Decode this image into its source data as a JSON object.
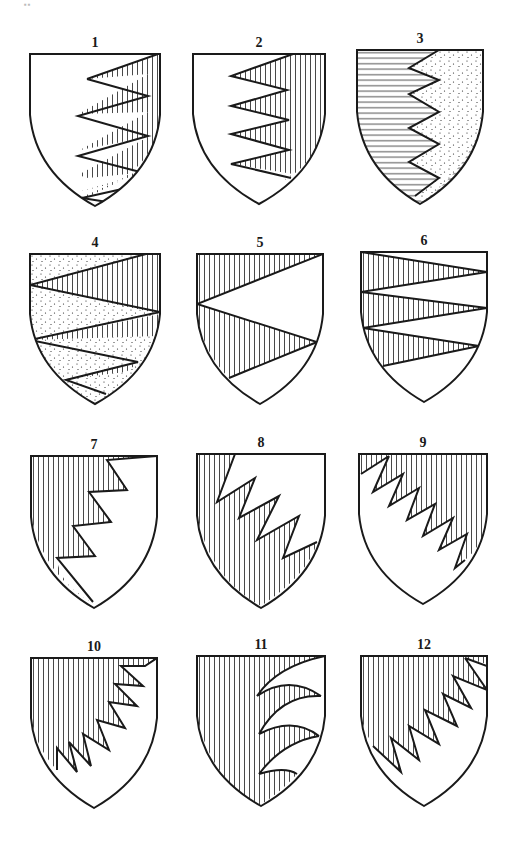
{
  "figure": {
    "corner_mark": "▪▪",
    "colors": {
      "ink": "#1a1a1a",
      "paper": "#ffffff"
    },
    "tinctures": {
      "vhatch": "vertical hatching",
      "hhatch": "horizontal hatching",
      "dots": "stippling",
      "plain": "plain"
    },
    "shields": [
      {
        "label": "1",
        "x": 30,
        "y": 54,
        "w": 130,
        "h": 152,
        "parts": [
          {
            "fill": "plain",
            "d": "SHIELD"
          },
          {
            "fill": "vhatch",
            "d": "M130 0 L130 0 L130 60 Q126 108 86 128 L36 150 L44 150 L52 146 L88 128 L48 138 L118 118 L58 124 L48 121 L118 83 L50 96 L118 58 L50 60 L52 58 L118 20 L57 25 L130 0 Z"
          }
        ],
        "lines": "M57 25 L128 0 M57 25 L118 42 L48 62 L118 82 L48 102 L118 120 M90 150 L52 144 L110 131"
      },
      {
        "label": "2",
        "x": 193,
        "y": 54,
        "w": 132,
        "h": 150,
        "parts": [
          {
            "fill": "plain",
            "d": "SHIELD"
          },
          {
            "fill": "vhatch",
            "d": "M100 0 L132 0 L132 60 Q128 108 88 128 L100 120 L38 110 L96 96 L38 80 L96 66 L38 52 L96 36 L38 22 Z"
          }
        ],
        "lines": "M100 0 L38 22 L94 36 L38 52 L96 66 L38 80 L96 96 L38 110 L98 124"
      },
      {
        "label": "3",
        "x": 357,
        "y": 50,
        "w": 126,
        "h": 154,
        "parts": [
          {
            "fill": "hhatch",
            "d": "SHIELD"
          },
          {
            "fill": "dots",
            "d": "M82 0 L126 0 L126 60 Q122 108 66 152 L58 146 L82 128 L52 112 L82 94 L52 78 L82 62 L52 44 L82 30 L52 18 Z"
          }
        ],
        "lines": "M82 0 L52 18 L82 30 L52 44 L82 62 L52 78 L82 94 L52 112 L82 128 L58 146"
      },
      {
        "label": "4",
        "x": 30,
        "y": 254,
        "w": 130,
        "h": 150,
        "parts": [
          {
            "fill": "dots",
            "d": "SHIELD"
          },
          {
            "fill": "vhatch",
            "d": "M116 0 L130 0 L130 60 L0 31 Z"
          },
          {
            "fill": "vhatch",
            "d": "M130 60 L127 82 L0 86 Z"
          },
          {
            "fill": "vhatch",
            "d": "M108 109 L96 118 L36 125 Z"
          }
        ],
        "lines": "M116 0 L0 31 L130 58 L0 86 L108 108 L36 126 L76 140"
      },
      {
        "label": "5",
        "x": 197,
        "y": 254,
        "w": 126,
        "h": 150,
        "parts": [
          {
            "fill": "plain",
            "d": "SHIELD"
          },
          {
            "fill": "vhatch",
            "d": "M0 0 L126 0 L0 50 Z"
          },
          {
            "fill": "vhatch",
            "d": "M0 50 L120 88 L32 124 Q6 98 0 60 Z"
          }
        ],
        "lines": "M126 0 L0 50 L120 88 L32 124"
      },
      {
        "label": "6",
        "x": 361,
        "y": 252,
        "w": 126,
        "h": 150,
        "parts": [
          {
            "fill": "plain",
            "d": "SHIELD"
          },
          {
            "fill": "vhatch",
            "d": "M0 0 L126 20 L0 40 Z"
          },
          {
            "fill": "vhatch",
            "d": "M0 40 L126 56 L2 76 Z"
          },
          {
            "fill": "vhatch",
            "d": "M4 76 L118 94 L22 114 Q8 98 4 82 Z"
          }
        ],
        "lines": "M0 0 L126 20 L0 40 L126 56 L2 76 L118 94 L22 114"
      },
      {
        "label": "7",
        "x": 31,
        "y": 456,
        "w": 126,
        "h": 152,
        "parts": [
          {
            "fill": "plain",
            "d": "SHIELD"
          },
          {
            "fill": "vhatch",
            "d": "M0 0 L126 0 L76 4 L96 34 L58 36 L80 66 L42 70 L64 100 L26 102 Q28 130 64 148 Q12 120 0 60 Z"
          }
        ],
        "lines": "M126 0 L76 4 L96 34 L58 36 L80 66 L42 70 L64 100 L26 102 L62 146"
      },
      {
        "label": "8",
        "x": 197,
        "y": 454,
        "w": 128,
        "h": 154,
        "parts": [
          {
            "fill": "plain",
            "d": "SHIELD"
          },
          {
            "fill": "vhatch",
            "d": "M0 0 L38 0 L20 48 L58 24 L42 64 L82 42 L60 86 L102 62 L86 104 L120 88 Q112 120 64 152 Q12 124 0 60 Z"
          }
        ],
        "lines": "M38 0 L20 48 L58 24 L42 64 L82 42 L60 86 L102 62 L86 104 L120 88"
      },
      {
        "label": "9",
        "x": 359,
        "y": 454,
        "w": 128,
        "h": 150,
        "parts": [
          {
            "fill": "plain",
            "d": "SHIELD"
          },
          {
            "fill": "vhatch",
            "d": "M0 0 L128 0 L128 60 Q126 90 106 106 L96 114 L108 80 L80 96 L94 64 L64 82 L76 50 L48 66 L60 34 L30 52 L44 20 L14 38 L30 4 L2 20 Z"
          }
        ],
        "lines": "M30 2 L2 20 M30 2 L14 38 L44 20 L30 52 L60 34 L48 66 L76 50 L64 82 L94 64 L80 96 L108 80 L96 114 L106 106"
      },
      {
        "label": "10",
        "x": 31,
        "y": 658,
        "w": 126,
        "h": 150,
        "parts": [
          {
            "fill": "plain",
            "d": "SHIELD"
          },
          {
            "fill": "vhatch",
            "d": "M0 0 L126 0 L114 8 L90 8 L112 28 L84 26 L106 48 L78 44 L94 70 L66 62 L78 92 L52 76 L60 108 L38 84 L46 114 L26 90 L26 112 Q6 92 0 60 Z"
          }
        ],
        "lines": "M126 0 L114 8 L90 8 L112 28 L84 26 L106 48 L78 44 L94 70 L66 62 L78 92 L52 76 L60 108 L38 84 L46 114 L26 90 L26 112"
      },
      {
        "label": "11",
        "x": 197,
        "y": 656,
        "w": 128,
        "h": 150,
        "parts": [
          {
            "fill": "plain",
            "d": "SHIELD"
          },
          {
            "fill": "vhatch",
            "d": "M0 0 L128 0 Q80 10 60 40 Q92 18 124 40 Q84 38 62 78 Q96 60 122 80 Q86 86 62 118 Q88 110 100 118 Q84 136 62 150 Q14 124 0 60 Z"
          }
        ],
        "lines": "M128 0 Q80 10 60 40 M60 40 Q92 18 124 40 M124 40 Q84 38 62 78 M62 78 Q96 60 122 80 M122 80 Q86 86 62 118 M62 118 Q88 110 100 118"
      },
      {
        "label": "12",
        "x": 361,
        "y": 656,
        "w": 126,
        "h": 150,
        "parts": [
          {
            "fill": "plain",
            "d": "SHIELD"
          },
          {
            "fill": "vhatch",
            "d": "M0 0 L126 0 L126 8 L104 2 L126 34 L92 20 L110 52 L82 38 L96 70 L64 54 L78 88 L48 70 L58 104 L30 82 L40 116 L12 90 Q2 72 0 60 Z"
          }
        ],
        "lines": "M104 2 L126 34 L92 20 L110 52 L82 38 L96 70 L64 54 L78 88 L48 70 L58 104 L30 82 L40 116 L12 90 M104 2 L126 10"
      }
    ]
  }
}
